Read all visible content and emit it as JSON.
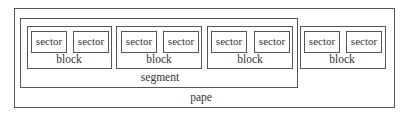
{
  "diagram": {
    "pape": {
      "label": "pape"
    },
    "segment": {
      "label": "segment"
    },
    "blocks": [
      {
        "label": "block",
        "sectors": [
          "sector",
          "sector"
        ]
      },
      {
        "label": "block",
        "sectors": [
          "sector",
          "sector"
        ]
      },
      {
        "label": "block",
        "sectors": [
          "sector",
          "sector"
        ]
      },
      {
        "label": "block",
        "sectors": [
          "sector",
          "sector"
        ]
      }
    ]
  }
}
